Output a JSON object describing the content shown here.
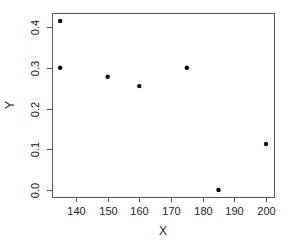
{
  "chart_data": {
    "type": "scatter",
    "title": "",
    "xlabel": "X",
    "ylabel": "Y",
    "xlim": [
      133,
      202
    ],
    "ylim": [
      -0.017,
      0.435
    ],
    "xticks": [
      140,
      150,
      160,
      170,
      180,
      190,
      200
    ],
    "yticks": [
      0.0,
      0.1,
      0.2,
      0.3,
      0.4
    ],
    "xtick_labels": [
      "140",
      "150",
      "160",
      "170",
      "180",
      "190",
      "200"
    ],
    "ytick_labels": [
      "0.0",
      "0.1",
      "0.2",
      "0.3",
      "0.4"
    ],
    "grid": false,
    "legend": null,
    "points": [
      {
        "x": 135,
        "y": 0.415
      },
      {
        "x": 135,
        "y": 0.3
      },
      {
        "x": 150,
        "y": 0.278
      },
      {
        "x": 160,
        "y": 0.255
      },
      {
        "x": 175,
        "y": 0.3
      },
      {
        "x": 185,
        "y": 0.0
      },
      {
        "x": 200,
        "y": 0.113
      }
    ],
    "marker_color": "#000000",
    "axis_color": "#555555"
  },
  "layout": {
    "plot": {
      "left": 52,
      "top": 13,
      "right": 274,
      "bottom": 197
    },
    "x_px": {
      "v0": 140,
      "p0": 76,
      "v1": 200,
      "p1": 266
    },
    "y_px": {
      "v0": 0.0,
      "p0": 190,
      "v1": 0.4,
      "p1": 27
    }
  }
}
